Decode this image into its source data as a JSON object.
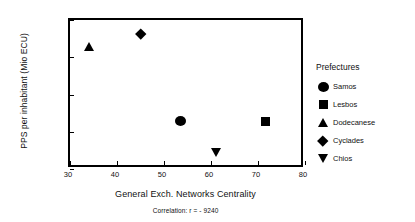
{
  "chart_data": {
    "type": "scatter",
    "title": "",
    "xlabel": "General Exch. Networks Centrality",
    "ylabel": "PPS per inhabitant (Mio ECU)",
    "xlim": [
      30,
      80
    ],
    "ylim": [
      6000,
      10000
    ],
    "xticks": [
      "30",
      "40",
      "50",
      "60",
      "70",
      "80"
    ],
    "xtick_values": [
      30,
      40,
      50,
      60,
      70,
      80
    ],
    "yticks": [
      "6000",
      "7000",
      "8000",
      "9000",
      "10000"
    ],
    "ytick_values": [
      6000,
      7000,
      8000,
      9000,
      10000
    ],
    "grid": false,
    "legend_position": "right",
    "legend_title": "Prefectures",
    "annotation": "Correlation: r = - 9240",
    "series": [
      {
        "name": "Samos",
        "marker": "circle",
        "x": 53.5,
        "y": 7300
      },
      {
        "name": "Lesbos",
        "marker": "square",
        "x": 71.5,
        "y": 7280
      },
      {
        "name": "Dodecanese",
        "marker": "triangle-up",
        "x": 34.0,
        "y": 9300
      },
      {
        "name": "Cyclades",
        "marker": "diamond",
        "x": 45.0,
        "y": 9620
      },
      {
        "name": "Chios",
        "marker": "triangle-down",
        "x": 61.0,
        "y": 6440
      }
    ],
    "colors": {
      "marker": "#000000",
      "axis": "#000000",
      "background": "#ffffff"
    }
  },
  "axes": {
    "x_title": "General Exch. Networks Centrality",
    "y_title": "PPS per inhabitant (Mio ECU)"
  },
  "caption": {
    "correlation": "Correlation: r = - 9240"
  },
  "legend": {
    "title": "Prefectures",
    "items": [
      {
        "label": "Samos",
        "marker": "circle"
      },
      {
        "label": "Lesbos",
        "marker": "square"
      },
      {
        "label": "Dodecanese",
        "marker": "triangle-up"
      },
      {
        "label": "Cyclades",
        "marker": "diamond"
      },
      {
        "label": "Chios",
        "marker": "triangle-down"
      }
    ]
  }
}
